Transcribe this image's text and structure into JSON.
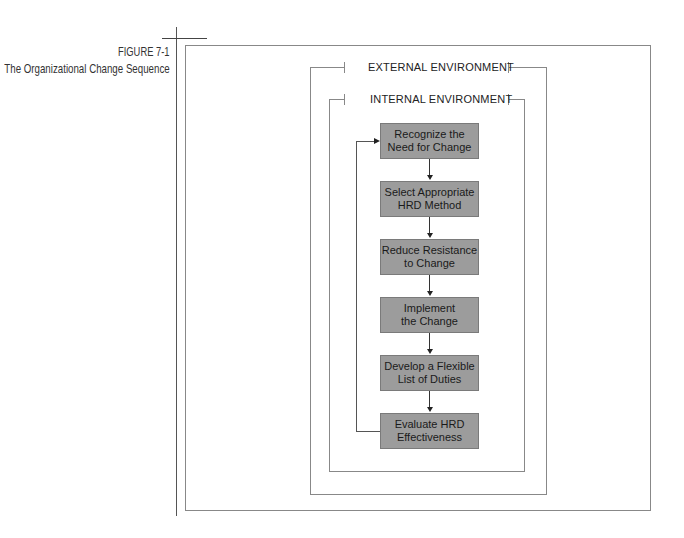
{
  "figure": {
    "number": "FIGURE 7-1",
    "title": "The Organizational Change Sequence"
  },
  "environments": {
    "external": "EXTERNAL ENVIRONMENT",
    "internal": "INTERNAL ENVIRONMENT"
  },
  "steps": [
    {
      "label": "Recognize the\nNeed for Change"
    },
    {
      "label": "Select Appropriate\nHRD Method"
    },
    {
      "label": "Reduce Resistance\nto Change"
    },
    {
      "label": "Implement\nthe Change"
    },
    {
      "label": "Develop a Flexible\nList of Duties"
    },
    {
      "label": "Evaluate HRD\nEffectiveness"
    }
  ],
  "colors": {
    "box_fill": "#9c9c9c",
    "line": "#888888",
    "text": "#1a1a1a"
  }
}
